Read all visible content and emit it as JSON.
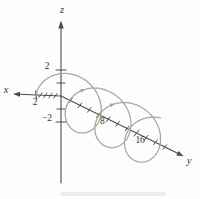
{
  "figure": {
    "background_color": "#fefefe",
    "axis_color": "#4b4b47",
    "curve_color": "#a9a59d",
    "text_color": "#35352f",
    "axes": {
      "x": {
        "label": "x",
        "ticks": [
          {
            "v": 0.45
          },
          {
            "v": 0.85
          },
          {
            "v": 1.25
          },
          {
            "v": 1.65
          },
          {
            "v": 2,
            "label": "2"
          }
        ]
      },
      "y": {
        "label": "y",
        "ticks": [
          {
            "v": 2
          },
          {
            "v": 4
          },
          {
            "v": 6
          },
          {
            "v": 8,
            "label": "8"
          },
          {
            "v": 10
          },
          {
            "v": 12
          },
          {
            "v": 14
          },
          {
            "v": 16,
            "label": "16"
          },
          {
            "v": 18
          },
          {
            "v": 20
          },
          {
            "v": 22
          }
        ]
      },
      "z": {
        "label": "z",
        "ticks": [
          {
            "v": 1
          },
          {
            "v": 2,
            "label": "2"
          },
          {
            "v": -1
          },
          {
            "v": -2,
            "label": "−2"
          }
        ]
      }
    },
    "curve": {
      "type": "helix",
      "around_axis": "y",
      "radius": 2,
      "t_range": [
        0,
        20.55
      ],
      "direction_arrows_t": [
        7.35,
        13.62
      ]
    }
  }
}
